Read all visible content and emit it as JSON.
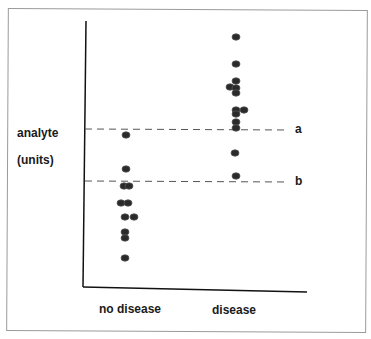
{
  "chart_data": {
    "type": "scatter",
    "title": "",
    "xlabel": "",
    "ylabel": "analyte (units)",
    "categories": [
      "no disease",
      "disease"
    ],
    "series": [
      {
        "name": "no disease",
        "points_px": [
          [
            126,
            135
          ],
          [
            126,
            169
          ],
          [
            124,
            186
          ],
          [
            129,
            186
          ],
          [
            121,
            203
          ],
          [
            128,
            203
          ],
          [
            125,
            217
          ],
          [
            134,
            217
          ],
          [
            125,
            232
          ],
          [
            125,
            238
          ],
          [
            125,
            258
          ]
        ]
      },
      {
        "name": "disease",
        "points_px": [
          [
            236,
            37
          ],
          [
            236,
            64
          ],
          [
            236,
            81
          ],
          [
            230,
            87
          ],
          [
            236,
            88
          ],
          [
            236,
            93
          ],
          [
            236,
            110
          ],
          [
            244,
            110
          ],
          [
            236,
            114
          ],
          [
            236,
            122
          ],
          [
            236,
            128
          ],
          [
            235,
            153
          ],
          [
            236,
            176
          ]
        ]
      }
    ],
    "thresholds": [
      {
        "label": "a",
        "y_px": 129
      },
      {
        "label": "b",
        "y_px": 181
      }
    ],
    "axis_ticks": "none",
    "grid": false,
    "legend": "none"
  },
  "labels": {
    "y_line1": "analyte",
    "y_line2": "(units)",
    "x_cat1": "no disease",
    "x_cat2": "disease",
    "thr_a": "a",
    "thr_b": "b"
  }
}
